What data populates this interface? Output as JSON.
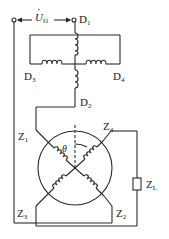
{
  "diagram": {
    "type": "circuit-schematic",
    "title": "",
    "stroke_color": "#2a2a2a",
    "voltage_label": {
      "symbol": "U",
      "dot": "·",
      "sub": "f1"
    },
    "terminals": {
      "D1": {
        "main": "D",
        "sub": "1"
      },
      "D2": {
        "main": "D",
        "sub": "2"
      },
      "D3": {
        "main": "D",
        "sub": "3"
      },
      "D4": {
        "main": "D",
        "sub": "4"
      }
    },
    "rotor_windings": {
      "Z1": {
        "main": "Z",
        "sub": "1"
      },
      "Z2": {
        "main": "Z",
        "sub": "2"
      },
      "Z3": {
        "main": "Z",
        "sub": "3"
      },
      "Z4": {
        "main": "Z",
        "sub": "4"
      }
    },
    "load": {
      "main": "Z",
      "sub": "L"
    },
    "angle": "θ"
  }
}
